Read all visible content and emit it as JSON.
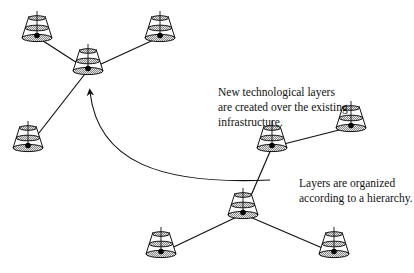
{
  "diagram": {
    "title": "",
    "captions": {
      "top": {
        "lines": [
          "New technological layers",
          "are created over the existing",
          "infrastructure."
        ]
      },
      "bottom": {
        "lines": [
          "Layers are organized",
          "according to a hierarchy."
        ]
      }
    },
    "groups": [
      {
        "id": "new-layer-network",
        "nodes": [
          {
            "id": "A",
            "x": 37,
            "y": 38
          },
          {
            "id": "B",
            "x": 160,
            "y": 38
          },
          {
            "id": "C",
            "x": 88,
            "y": 71
          },
          {
            "id": "D",
            "x": 28,
            "y": 148
          }
        ],
        "edges": [
          [
            "C",
            "A"
          ],
          [
            "C",
            "B"
          ],
          [
            "C",
            "D"
          ]
        ]
      },
      {
        "id": "existing-infrastructure",
        "nodes": [
          {
            "id": "E",
            "x": 272,
            "y": 148
          },
          {
            "id": "F",
            "x": 351,
            "y": 128
          },
          {
            "id": "G",
            "x": 243,
            "y": 215
          },
          {
            "id": "H",
            "x": 161,
            "y": 254
          },
          {
            "id": "I",
            "x": 334,
            "y": 254
          }
        ],
        "edges": [
          [
            "E",
            "F"
          ],
          [
            "G",
            "E"
          ],
          [
            "G",
            "H"
          ],
          [
            "G",
            "I"
          ]
        ]
      }
    ],
    "arrow": {
      "from": [
        270,
        180
      ],
      "to": [
        90,
        92
      ],
      "style": "curved"
    },
    "colors": {
      "stroke": "#111111",
      "fill_hatch": "#9a9a9a",
      "background": "#ffffff"
    },
    "node_icon": "layered-cone-icon"
  }
}
